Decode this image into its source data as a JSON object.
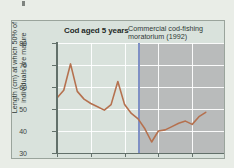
{
  "figure": {
    "background_color": "#e9ede7",
    "panel_background": "#d9e2dc",
    "shaded_background": "#b9bbbb",
    "line_color": "#b5714f",
    "moratorium_line_color": "#7f90c4",
    "axis_color": "#62706a",
    "gridline_color": "#ffffff"
  },
  "chart_data": {
    "type": "line",
    "title": "Cod aged 5 years",
    "xlabel": "",
    "ylabel": "Length (cm) at which 50% of individuals are mature",
    "xlim": [
      1980,
      2005
    ],
    "ylim": [
      30,
      80
    ],
    "xticks": [
      1980,
      1985,
      1990,
      1995,
      2000,
      2005
    ],
    "xtick_labels": [
      "1980",
      "1985",
      "1990",
      "1995",
      "2000",
      "2005"
    ],
    "yticks": [
      30,
      40,
      50,
      60,
      70,
      80
    ],
    "ytick_labels": [
      "30",
      "40",
      "50",
      "60",
      "70",
      "80"
    ],
    "grid": "both",
    "legend": "none",
    "annotations": [
      {
        "text": "Commercial cod-fishing moratorium (1992)",
        "type": "vertical-line-with-label",
        "x": 1992,
        "shaded_region": [
          1992,
          2005
        ]
      }
    ],
    "series": [
      {
        "name": "Length at which 50% of individuals are mature",
        "color": "#b5714f",
        "x": [
          1980,
          1981,
          1982,
          1983,
          1984,
          1985,
          1986,
          1987,
          1988,
          1989,
          1990,
          1991,
          1992,
          1993,
          1994,
          1995,
          1996,
          1997,
          1998,
          1999,
          2000,
          2001,
          2002
        ],
        "values": [
          55.0,
          58.5,
          70.5,
          58.0,
          54.5,
          52.5,
          51.0,
          49.5,
          52.0,
          62.5,
          52.0,
          48.0,
          45.5,
          41.0,
          35.0,
          40.0,
          40.5,
          42.0,
          43.5,
          44.5,
          43.0,
          46.5,
          48.5
        ]
      }
    ]
  }
}
